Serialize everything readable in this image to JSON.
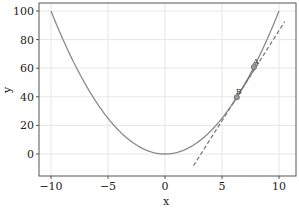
{
  "chart_data": {
    "type": "line",
    "title": "",
    "xlabel": "x",
    "ylabel": "y",
    "xlim": [
      -11.1,
      11.4
    ],
    "ylim": [
      -15.5,
      105
    ],
    "xticks": [
      -10,
      -5,
      0,
      5,
      10
    ],
    "yticks": [
      0,
      20,
      40,
      60,
      80,
      100
    ],
    "xtick_labels": [
      "−10",
      "−5",
      "0",
      "5",
      "10"
    ],
    "ytick_labels": [
      "0",
      "20",
      "40",
      "60",
      "80",
      "100"
    ],
    "grid": true,
    "legend": null,
    "series": [
      {
        "name": "curve",
        "function": "y = x^2",
        "x_range": [
          -10,
          10
        ],
        "style": "solid",
        "color": "#8a8a8a"
      },
      {
        "name": "secant",
        "x": [
          6.0,
          8.2
        ],
        "y": [
          36.0,
          64.0
        ],
        "style": "solid",
        "color": "#7a7a7a"
      },
      {
        "name": "tangent",
        "x": [
          2.5,
          10.5
        ],
        "y": [
          -8.2,
          92.6
        ],
        "style": "dashed",
        "color": "#7a7a7a"
      }
    ],
    "points": [
      {
        "label": "A",
        "x": 7.8,
        "y": 60.8
      },
      {
        "label": "B",
        "x": 6.3,
        "y": 39.7
      }
    ]
  },
  "colors": {
    "axis": "#555555",
    "grid": "#e6e6e6",
    "curve": "#8a8a8a",
    "line": "#7a7a7a"
  }
}
